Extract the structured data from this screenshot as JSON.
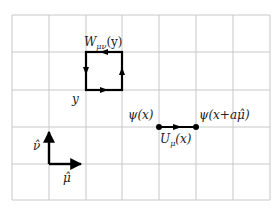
{
  "diagram": {
    "type": "lattice-gauge-theory",
    "grid": {
      "columns": 7,
      "rows": 5,
      "x_lines": [
        12,
        49,
        86,
        122,
        159,
        196,
        233,
        270
      ],
      "y_lines": [
        15,
        52,
        90,
        127,
        164,
        200
      ],
      "line_color": "#c8c8c8"
    },
    "plaquette": {
      "label": "W",
      "label_sub": "μν",
      "label_arg": "(y)",
      "corner_label": "y",
      "color": "#000000"
    },
    "link": {
      "start_label": "ψ(x)",
      "end_label_prefix": "ψ(x+a",
      "end_label_hat": "μ̂",
      "end_label_suffix": ")",
      "link_label": "U",
      "link_label_sub": "μ",
      "link_label_arg": "(x)",
      "color": "#000000"
    },
    "basis": {
      "nu_label": "ν̂",
      "mu_label": "μ̂"
    }
  }
}
